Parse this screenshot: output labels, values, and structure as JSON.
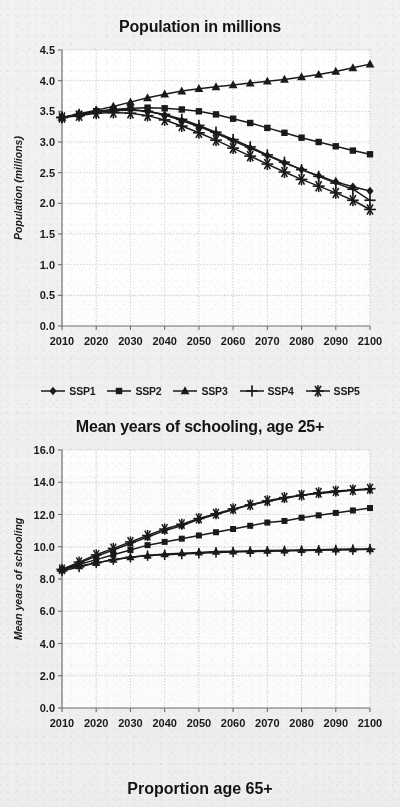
{
  "page": {
    "background_color": "#f2f2f0",
    "ink_color": "#1a1a1a",
    "grid_color": "#c8c8c8"
  },
  "figures": [
    {
      "name": "population-chart",
      "title": "Population in millions",
      "ylabel": "Population (millions)"
    },
    {
      "name": "schooling-chart",
      "title": "Mean years of schooling, age 25+",
      "ylabel": "Mean years of schooling"
    }
  ],
  "bottom_title": "Proportion age 65+",
  "legend": {
    "items": [
      {
        "label": "SSP1",
        "marker": "diamond-marker"
      },
      {
        "label": "SSP2",
        "marker": "square-marker"
      },
      {
        "label": "SSP3",
        "marker": "triangle-marker"
      },
      {
        "label": "SSP4",
        "marker": "plus-marker"
      },
      {
        "label": "SSP5",
        "marker": "asterisk-marker"
      }
    ]
  },
  "chart_data": [
    {
      "type": "line",
      "name": "population-chart",
      "title": "Population in millions",
      "xlabel": "",
      "ylabel": "Population (millions)",
      "x": [
        2010,
        2015,
        2020,
        2025,
        2030,
        2035,
        2040,
        2045,
        2050,
        2055,
        2060,
        2065,
        2070,
        2075,
        2080,
        2085,
        2090,
        2095,
        2100
      ],
      "xticks": [
        2010,
        2020,
        2030,
        2040,
        2050,
        2060,
        2070,
        2080,
        2090,
        2100
      ],
      "xlim": [
        2010,
        2100
      ],
      "ylim": [
        0.0,
        4.5
      ],
      "yticks": [
        0.0,
        0.5,
        1.0,
        1.5,
        2.0,
        2.5,
        3.0,
        3.5,
        4.0,
        4.5
      ],
      "grid": true,
      "legend_position": "below",
      "series": [
        {
          "name": "SSP1",
          "marker": "diamond",
          "values": [
            3.4,
            3.44,
            3.49,
            3.52,
            3.53,
            3.5,
            3.44,
            3.35,
            3.25,
            3.14,
            3.02,
            2.9,
            2.78,
            2.66,
            2.55,
            2.45,
            2.35,
            2.27,
            2.2
          ]
        },
        {
          "name": "SSP2",
          "marker": "square",
          "values": [
            3.4,
            3.45,
            3.5,
            3.53,
            3.55,
            3.56,
            3.55,
            3.53,
            3.5,
            3.45,
            3.38,
            3.31,
            3.23,
            3.15,
            3.07,
            3.0,
            2.93,
            2.86,
            2.8
          ]
        },
        {
          "name": "SSP3",
          "marker": "triangle",
          "values": [
            3.4,
            3.46,
            3.52,
            3.58,
            3.65,
            3.72,
            3.78,
            3.83,
            3.87,
            3.9,
            3.93,
            3.96,
            3.99,
            4.02,
            4.06,
            4.1,
            4.15,
            4.21,
            4.27
          ]
        },
        {
          "name": "SSP4",
          "marker": "plus",
          "values": [
            3.4,
            3.45,
            3.49,
            3.51,
            3.52,
            3.5,
            3.45,
            3.37,
            3.27,
            3.16,
            3.04,
            2.92,
            2.79,
            2.67,
            2.55,
            2.44,
            2.33,
            2.23,
            2.05
          ]
        },
        {
          "name": "SSP5",
          "marker": "asterisk",
          "values": [
            3.4,
            3.43,
            3.47,
            3.48,
            3.47,
            3.43,
            3.36,
            3.26,
            3.15,
            3.03,
            2.9,
            2.77,
            2.64,
            2.51,
            2.39,
            2.28,
            2.17,
            2.05,
            1.9
          ]
        }
      ]
    },
    {
      "type": "line",
      "name": "schooling-chart",
      "title": "Mean years of schooling, age 25+",
      "xlabel": "",
      "ylabel": "Mean years of schooling",
      "x": [
        2010,
        2015,
        2020,
        2025,
        2030,
        2035,
        2040,
        2045,
        2050,
        2055,
        2060,
        2065,
        2070,
        2075,
        2080,
        2085,
        2090,
        2095,
        2100
      ],
      "xticks": [
        2010,
        2020,
        2030,
        2040,
        2050,
        2060,
        2070,
        2080,
        2090,
        2100
      ],
      "xlim": [
        2010,
        2100
      ],
      "ylim": [
        0.0,
        16.0
      ],
      "yticks": [
        0.0,
        2.0,
        4.0,
        6.0,
        8.0,
        10.0,
        12.0,
        14.0,
        16.0
      ],
      "grid": true,
      "legend_position": "none",
      "series": [
        {
          "name": "SSP1",
          "marker": "diamond",
          "values": [
            8.6,
            9.0,
            9.4,
            9.8,
            10.2,
            10.6,
            11.0,
            11.3,
            11.7,
            12.0,
            12.3,
            12.6,
            12.8,
            13.0,
            13.2,
            13.3,
            13.4,
            13.5,
            13.55
          ]
        },
        {
          "name": "SSP2",
          "marker": "square",
          "values": [
            8.6,
            8.9,
            9.2,
            9.5,
            9.8,
            10.1,
            10.3,
            10.5,
            10.7,
            10.9,
            11.1,
            11.3,
            11.5,
            11.6,
            11.8,
            11.95,
            12.1,
            12.25,
            12.4
          ]
        },
        {
          "name": "SSP3",
          "marker": "triangle",
          "values": [
            8.6,
            8.8,
            9.0,
            9.2,
            9.35,
            9.45,
            9.55,
            9.6,
            9.65,
            9.7,
            9.72,
            9.74,
            9.76,
            9.78,
            9.8,
            9.82,
            9.84,
            9.86,
            9.85
          ]
        },
        {
          "name": "SSP4",
          "marker": "plus",
          "values": [
            8.5,
            8.75,
            9.0,
            9.2,
            9.35,
            9.45,
            9.5,
            9.55,
            9.6,
            9.65,
            9.68,
            9.7,
            9.72,
            9.74,
            9.76,
            9.78,
            9.8,
            9.82,
            9.85
          ]
        },
        {
          "name": "SSP5",
          "marker": "asterisk",
          "values": [
            8.6,
            9.05,
            9.5,
            9.9,
            10.3,
            10.7,
            11.1,
            11.4,
            11.75,
            12.05,
            12.35,
            12.6,
            12.85,
            13.05,
            13.2,
            13.35,
            13.45,
            13.52,
            13.6
          ]
        }
      ]
    }
  ]
}
